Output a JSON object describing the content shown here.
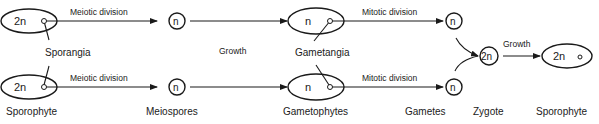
{
  "diagram": {
    "type": "life-cycle",
    "top_row": {
      "sporophyte_ploidy": "2n",
      "arrow1_label": "Meiotic division",
      "meiospore_ploidy": "n",
      "growth_label": "Growth",
      "gametophyte_ploidy": "n",
      "arrow2_label": "Mitotic division",
      "gamete_ploidy": "n"
    },
    "bottom_row": {
      "sporophyte_ploidy": "2n",
      "arrow1_label": "Meiotic division",
      "meiospore_ploidy": "n",
      "gametophyte_ploidy": "n",
      "arrow2_label": "Mitotic division",
      "gamete_ploidy": "n"
    },
    "middle_labels": {
      "sporangia": "Sporangia",
      "gametangia": "Gametangia"
    },
    "zygote": {
      "ploidy": "2n",
      "growth_label": "Growth",
      "new_sporophyte_ploidy": "2n"
    },
    "bottom_labels": {
      "sporophyte": "Sporophyte",
      "meiospores": "Meiospores",
      "gametophytes": "Gametophytes",
      "gametes": "Gametes",
      "zygote": "Zygote",
      "sporophyte_final": "Sporophyte"
    }
  }
}
